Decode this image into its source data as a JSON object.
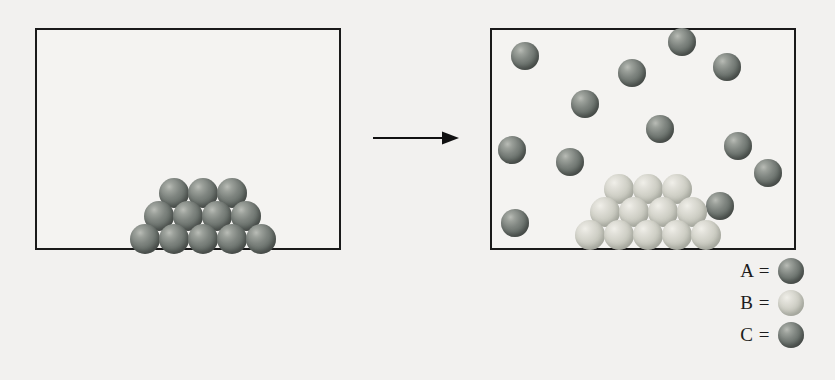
{
  "figure": {
    "type": "particle-phase-diagram",
    "background_color": "#f2f1ef",
    "box_border_color": "#1a1a1a",
    "colors": {
      "dark_sphere": "#6b726d",
      "light_sphere": "#c3c4ba",
      "arrow": "#111111",
      "text": "#1c1c1c"
    }
  },
  "left_panel": {
    "name": "before-container",
    "box": {
      "x": 35,
      "y": 28,
      "width": 306,
      "height": 222
    },
    "groups": [
      {
        "name": "dark-solid-stack",
        "species": "A",
        "color": "dark",
        "arrangement": "pyramid",
        "rows": [
          3,
          4,
          5
        ],
        "count": 12,
        "radius": 15,
        "spheres": [
          {
            "cx": 174,
            "cy": 193
          },
          {
            "cx": 203,
            "cy": 193
          },
          {
            "cx": 232,
            "cy": 193
          },
          {
            "cx": 159,
            "cy": 216
          },
          {
            "cx": 188,
            "cy": 216
          },
          {
            "cx": 217,
            "cy": 216
          },
          {
            "cx": 246,
            "cy": 216
          },
          {
            "cx": 145,
            "cy": 239
          },
          {
            "cx": 174,
            "cy": 239
          },
          {
            "cx": 203,
            "cy": 239
          },
          {
            "cx": 232,
            "cy": 239
          },
          {
            "cx": 261,
            "cy": 239
          }
        ]
      }
    ]
  },
  "arrow": {
    "name": "reaction-arrow",
    "direction": "right",
    "x": 372,
    "y": 138,
    "length": 88
  },
  "right_panel": {
    "name": "after-container",
    "box": {
      "x": 490,
      "y": 28,
      "width": 306,
      "height": 222
    },
    "groups": [
      {
        "name": "dark-gas-particles",
        "species": "A",
        "color": "dark",
        "arrangement": "scattered",
        "count": 12,
        "radius": 14,
        "spheres": [
          {
            "cx": 525,
            "cy": 56
          },
          {
            "cx": 632,
            "cy": 73
          },
          {
            "cx": 682,
            "cy": 42
          },
          {
            "cx": 727,
            "cy": 67
          },
          {
            "cx": 585,
            "cy": 104
          },
          {
            "cx": 660,
            "cy": 129
          },
          {
            "cx": 512,
            "cy": 150
          },
          {
            "cx": 570,
            "cy": 162
          },
          {
            "cx": 738,
            "cy": 146
          },
          {
            "cx": 768,
            "cy": 173
          },
          {
            "cx": 720,
            "cy": 206
          },
          {
            "cx": 515,
            "cy": 223
          }
        ]
      },
      {
        "name": "light-solid-stack",
        "species": "B",
        "color": "light",
        "arrangement": "pyramid",
        "rows": [
          3,
          4,
          5
        ],
        "count": 12,
        "radius": 15,
        "spheres": [
          {
            "cx": 619,
            "cy": 189
          },
          {
            "cx": 648,
            "cy": 189
          },
          {
            "cx": 677,
            "cy": 189
          },
          {
            "cx": 605,
            "cy": 212
          },
          {
            "cx": 634,
            "cy": 212
          },
          {
            "cx": 663,
            "cy": 212
          },
          {
            "cx": 692,
            "cy": 212
          },
          {
            "cx": 590,
            "cy": 235
          },
          {
            "cx": 619,
            "cy": 235
          },
          {
            "cx": 648,
            "cy": 235
          },
          {
            "cx": 677,
            "cy": 235
          },
          {
            "cx": 706,
            "cy": 235
          }
        ]
      }
    ]
  },
  "legend": {
    "name": "species-legend",
    "x": 726,
    "y": 256,
    "entries": [
      {
        "label": "A =",
        "color": "dark",
        "swatch": "dark-sphere-swatch"
      },
      {
        "label": "B =",
        "color": "light",
        "swatch": "light-sphere-swatch"
      },
      {
        "label": "C =",
        "color": "dark",
        "swatch": "dark-sphere-swatch"
      }
    ]
  }
}
